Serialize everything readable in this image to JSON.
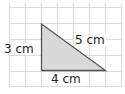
{
  "diagram": {
    "type": "right-triangle-on-grid",
    "grid": {
      "color": "#dcdcdc",
      "spacing_px": 16
    },
    "triangle": {
      "fill": "#d8d8d8",
      "stroke": "#555555"
    },
    "labels": {
      "height": "3 cm",
      "hypotenuse": "5 cm",
      "base": "4 cm"
    }
  }
}
